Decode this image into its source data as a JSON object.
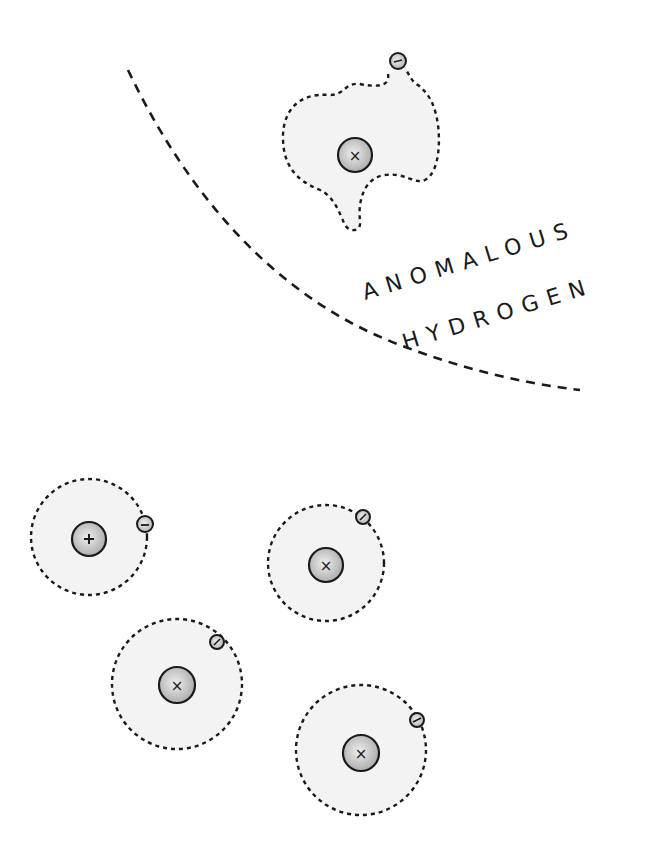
{
  "labels": {
    "line1": "ANOMALOUS",
    "line2": "HYDROGEN"
  },
  "colors": {
    "ink": "#1a1a1a",
    "cloud_fill": "#f2f2f2",
    "nucleus_fill": "#c8c8c8",
    "electron_fill": "#d6d6d6"
  },
  "symbols": {
    "proton": "+",
    "neutral_nucleus": "×",
    "electron": "−"
  },
  "atoms": [
    {
      "id": "anomalous",
      "nucleus_symbol": "×",
      "electron_symbol": "−"
    },
    {
      "id": "normal-plus",
      "nucleus_symbol": "+",
      "electron_symbol": "−"
    },
    {
      "id": "normal-1",
      "nucleus_symbol": "×",
      "electron_symbol": "/"
    },
    {
      "id": "normal-2",
      "nucleus_symbol": "×",
      "electron_symbol": "/"
    },
    {
      "id": "normal-3",
      "nucleus_symbol": "×",
      "electron_symbol": "/"
    }
  ]
}
